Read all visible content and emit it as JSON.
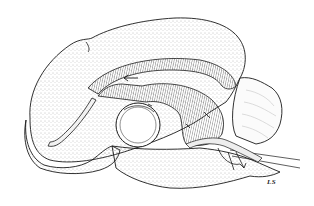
{
  "figure": {
    "style": "stippled pen-and-ink",
    "colors": {
      "ink": "#1a1a1a",
      "stipple": "#6a6a6a",
      "background": "#ffffff"
    },
    "regions": [
      "cerebral-cortex",
      "corpus-callosum",
      "fornix",
      "hippocampus",
      "thalamus",
      "cerebellum",
      "brainstem",
      "olfactory-bulb",
      "hypothalamus"
    ],
    "arrows": [
      "callosal-arrow",
      "fornix-arrows",
      "brainstem-arrows"
    ]
  },
  "signature": "LS"
}
